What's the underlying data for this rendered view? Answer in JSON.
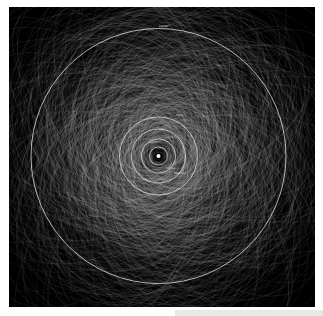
{
  "figure": {
    "background": "#000000",
    "orbit_color": "#cfcfcf",
    "center": [
      149.5,
      149
    ],
    "outer_orbit": {
      "radius": 127.5,
      "label": "Jupiter",
      "label_pos": [
        150,
        18
      ]
    },
    "planet_orbits": [
      {
        "name": "Mars",
        "radius": 39,
        "label_pos": [
          167,
          107
        ]
      },
      {
        "name": "Earth",
        "radius": 27,
        "label_pos": [
          140,
          134
        ]
      },
      {
        "name": "Venus",
        "radius": 17,
        "label_pos": [
          157,
          160
        ]
      },
      {
        "name": "Mercury",
        "radius": 9,
        "label_pos": [
          165,
          165
        ]
      }
    ],
    "sun": {
      "radius": 2,
      "color": "#ffffff"
    },
    "orbit_count": 900,
    "seed": 7
  }
}
